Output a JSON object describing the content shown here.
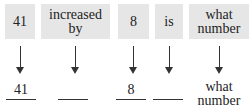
{
  "phrase_boxes": [
    {
      "text": "41"
    },
    {
      "text": "increased by"
    },
    {
      "text": "8"
    },
    {
      "text": "is"
    },
    {
      "text": "what number"
    }
  ],
  "translation_slots": [
    {
      "text": "41"
    },
    {
      "text": ""
    },
    {
      "text": "8"
    },
    {
      "text": ""
    },
    {
      "text": "what number"
    }
  ],
  "colors": {
    "box_fill": "#e6e6e6",
    "ink": "#333333"
  }
}
